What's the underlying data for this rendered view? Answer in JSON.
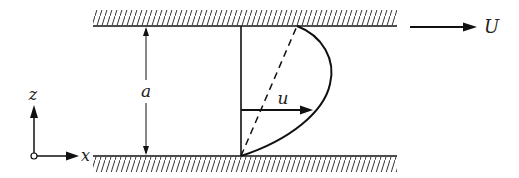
{
  "diagram": {
    "labels": {
      "gap": "a",
      "velocity": "u",
      "plate_speed": "U",
      "axis_x": "x",
      "axis_z": "z"
    },
    "colors": {
      "ink": "#111111",
      "background": "#ffffff"
    }
  }
}
